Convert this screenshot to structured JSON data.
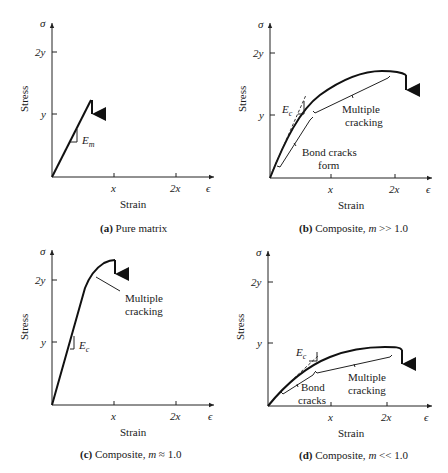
{
  "figure": {
    "axis_labels": {
      "y_symbol": "σ",
      "x_symbol": "ϵ",
      "y_title": "Stress",
      "x_title": "Strain",
      "y_ticks": [
        "y",
        "2y"
      ],
      "x_ticks": [
        "x",
        "2x"
      ]
    },
    "panels": [
      {
        "id": "a",
        "caption_tag": "(a)",
        "caption_text": " Pure matrix",
        "annotations": {
          "modulus": "E",
          "modulus_sub": "m"
        }
      },
      {
        "id": "b",
        "caption_tag": "(b)",
        "caption_text": " Composite, ",
        "caption_var": "m",
        "caption_rel": " >> 1.0",
        "annotations": {
          "modulus": "E",
          "modulus_sub": "c",
          "multiple_cracking_1": "Multiple",
          "multiple_cracking_2": "cracking",
          "bond_cracks_1": "Bond cracks",
          "bond_cracks_2": "form"
        }
      },
      {
        "id": "c",
        "caption_tag": "(c)",
        "caption_text": " Composite, ",
        "caption_var": "m",
        "caption_rel": " ≈ 1.0",
        "annotations": {
          "modulus": "E",
          "modulus_sub": "c",
          "multiple_cracking_1": "Multiple",
          "multiple_cracking_2": "cracking"
        }
      },
      {
        "id": "d",
        "caption_tag": "(d)",
        "caption_text": " Composite, ",
        "caption_var": "m",
        "caption_rel": " << 1.0",
        "annotations": {
          "modulus": "E",
          "modulus_sub": "c",
          "bond_cracks_1": "Bond",
          "bond_cracks_2": "cracks",
          "multiple_cracking_1": "Multiple",
          "multiple_cracking_2": "cracking"
        }
      }
    ]
  }
}
